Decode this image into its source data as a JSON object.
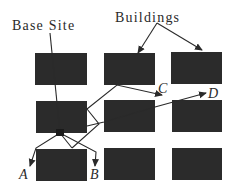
{
  "diagram": {
    "type": "site-route-diagram",
    "labels": {
      "base_site": "Base Site",
      "buildings": "Buildings"
    },
    "destinations": [
      {
        "id": "A",
        "label": "A"
      },
      {
        "id": "B",
        "label": "B"
      },
      {
        "id": "C",
        "label": "C"
      },
      {
        "id": "D",
        "label": "D"
      }
    ],
    "building_grid": {
      "rows": 3,
      "cols": 3,
      "color": "#2b2b2b"
    },
    "colors": {
      "background": "#ffffff",
      "building": "#2b2b2b",
      "line": "#2a2a2a",
      "text": "#2a2a2a"
    }
  }
}
